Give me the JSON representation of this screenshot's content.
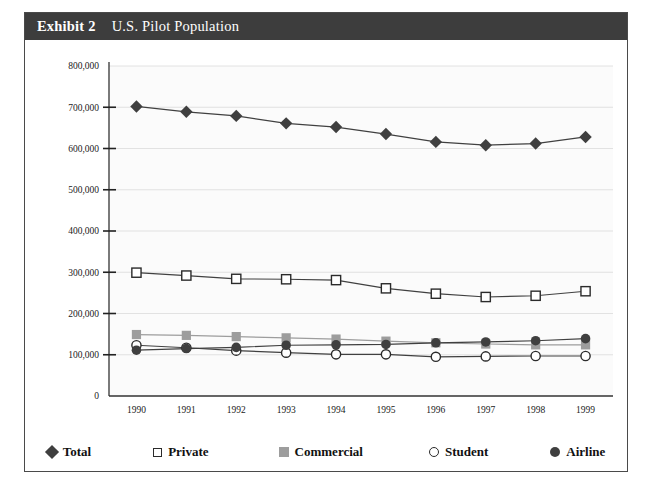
{
  "figure": {
    "exhibit_label": "Exhibit 2",
    "title": "U.S. Pilot Population"
  },
  "chart_data": {
    "type": "line",
    "title": "U.S. Pilot Population",
    "xlabel": "",
    "ylabel": "",
    "categories": [
      "1990",
      "1991",
      "1992",
      "1993",
      "1994",
      "1995",
      "1996",
      "1997",
      "1998",
      "1999"
    ],
    "x": [
      1990,
      1991,
      1992,
      1993,
      1994,
      1995,
      1996,
      1997,
      1998,
      1999
    ],
    "ylim": [
      0,
      800000
    ],
    "ytick_labels": [
      "0",
      "100,000",
      "200,000",
      "300,000",
      "400,000",
      "500,000",
      "600,000",
      "700,000",
      "800,000"
    ],
    "ytick_values": [
      0,
      100000,
      200000,
      300000,
      400000,
      500000,
      600000,
      700000,
      800000
    ],
    "grid": true,
    "legend_position": "bottom",
    "series": [
      {
        "name": "Total",
        "marker": "filled-diamond",
        "color": "#3f3f3f",
        "values": [
          702000,
          689000,
          679000,
          661000,
          652000,
          635000,
          616000,
          608000,
          612000,
          628000
        ]
      },
      {
        "name": "Private",
        "marker": "open-square",
        "color": "#2b2b2b",
        "values": [
          299000,
          292000,
          284000,
          283000,
          281000,
          261000,
          248000,
          240000,
          243000,
          254000
        ]
      },
      {
        "name": "Commercial",
        "marker": "filled-square",
        "color": "#9d9d9d",
        "values": [
          149000,
          147000,
          144000,
          141000,
          138000,
          133000,
          129000,
          126000,
          124000,
          124000
        ]
      },
      {
        "name": "Student",
        "marker": "open-circle",
        "color": "#2b2b2b",
        "values": [
          123000,
          117000,
          110000,
          105000,
          101000,
          101000,
          95000,
          96000,
          97000,
          97000
        ]
      },
      {
        "name": "Airline",
        "marker": "filled-circle",
        "color": "#3f3f3f",
        "values": [
          111000,
          115000,
          118000,
          123000,
          124000,
          125000,
          129000,
          131000,
          134000,
          139000
        ]
      }
    ]
  },
  "legend": {
    "items": [
      {
        "label": "Total",
        "marker": "filled-diamond"
      },
      {
        "label": "Private",
        "marker": "open-square"
      },
      {
        "label": "Commercial",
        "marker": "filled-square"
      },
      {
        "label": "Student",
        "marker": "open-circle"
      },
      {
        "label": "Airline",
        "marker": "filled-circle"
      }
    ]
  }
}
